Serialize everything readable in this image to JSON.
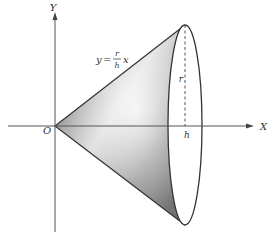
{
  "diagram": {
    "axes": {
      "x_label": "X",
      "y_label": "Y",
      "origin_label": "O"
    },
    "equation": {
      "lhs": "y",
      "eq": "=",
      "numerator": "r",
      "denominator": "h",
      "var": "x"
    },
    "dimensions": {
      "radius_label": "r",
      "height_label": "h"
    },
    "colors": {
      "axis": "#555555",
      "outline": "#333333",
      "shade_dark": "#6e6e6e",
      "shade_light": "#f2f2f2",
      "background": "#ffffff"
    }
  }
}
